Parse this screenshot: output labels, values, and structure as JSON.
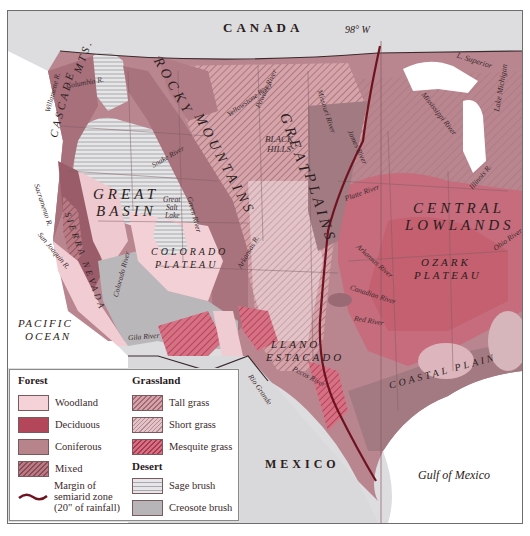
{
  "colors": {
    "woodland": "#f4d2d7",
    "deciduous": "#b4465a",
    "coniferous": "#b8848b",
    "mixed": "#a86a74",
    "tall_grass": "#c08a92",
    "short_grass": "#d4aeb3",
    "mesquite_grass": "#c4566a",
    "sage_brush": "#dcdcde",
    "creosote_brush": "#b7b5b8",
    "border_line": "#5a4a4c",
    "semiarid_margin": "#6e1420",
    "foreign_land": "#dddcde",
    "water": "#ffffff",
    "eastern_mixed": "#b7868e",
    "eastern_deciduous": "#c46a7a"
  },
  "labels": {
    "countries": {
      "canada": "CANADA",
      "mexico": "MEXICO"
    },
    "meridian": "98° W",
    "water_bodies": {
      "pacific_line1": "PACIFIC",
      "pacific_line2": "OCEAN",
      "gulf": "Gulf of Mexico",
      "superior": "L. Superior",
      "michigan": "Lake Michigan",
      "great_salt_line1": "Great",
      "great_salt_line2": "Salt",
      "great_salt_line3": "Lake"
    },
    "regions": {
      "cascade": "CASCADE",
      "cascade_mts": "MTS.",
      "rocky_1": "ROCKY",
      "rocky_2": "MOUNTAINS",
      "great_basin_1": "GREAT",
      "great_basin_2": "BASIN",
      "sierra": "SIERRA NEVADA",
      "colorado_1": "COLORADO",
      "colorado_2": "PLATEAU",
      "great_plains_1": "GREAT",
      "great_plains_2": "PLAINS",
      "black_hills_1": "BLACK",
      "black_hills_2": "HILLS",
      "llano_1": "LLANO",
      "llano_2": "ESTACADO",
      "central_1": "CENTRAL",
      "central_2": "LOWLANDS",
      "ozark_1": "OZARK",
      "ozark_2": "PLATEAU",
      "coastal": "COASTAL PLAIN"
    },
    "rivers": {
      "columbia": "Columbia R.",
      "willamette": "Willamette R.",
      "snake": "Snake River",
      "sacramento": "Sacramento R.",
      "san_joaquin": "San Joaquin R.",
      "colorado": "Colorado River",
      "gila": "Gila River",
      "green": "Green River",
      "yellowstone": "Yellowstone River",
      "missouri": "Missouri River",
      "powder": "Powder River",
      "james": "James River",
      "platte": "Platte River",
      "arkansas": "Arkansas River",
      "canadian": "Canadian River",
      "red": "Red River",
      "mississippi": "Mississippi River",
      "illinois": "Illinois R.",
      "ohio": "Ohio River",
      "rio_grande": "Rio Grande",
      "pecos": "Pecos River",
      "arkansas_upper": "Arkansas R."
    }
  },
  "legend": {
    "forest": {
      "heading": "Forest",
      "items": [
        {
          "label": "Woodland",
          "key": "woodland"
        },
        {
          "label": "Deciduous",
          "key": "deciduous"
        },
        {
          "label": "Coniferous",
          "key": "coniferous"
        },
        {
          "label": "Mixed",
          "key": "mixed"
        }
      ]
    },
    "grassland": {
      "heading": "Grassland",
      "items": [
        {
          "label": "Tall grass",
          "key": "tall_grass"
        },
        {
          "label": "Short grass",
          "key": "short_grass"
        },
        {
          "label": "Mesquite grass",
          "key": "mesquite_grass"
        }
      ]
    },
    "desert": {
      "heading": "Desert",
      "items": [
        {
          "label": "Sage brush",
          "key": "sage_brush"
        },
        {
          "label": "Creosote brush",
          "key": "creosote_brush"
        }
      ]
    },
    "margin": {
      "line1": "Margin of",
      "line2": "semiarid zone",
      "line3": "(20\" of rainfall)"
    }
  }
}
